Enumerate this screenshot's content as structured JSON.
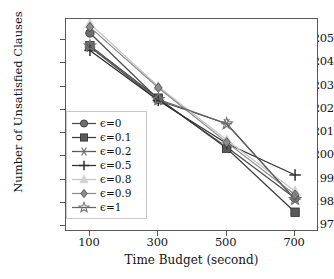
{
  "chart_data": {
    "type": "line",
    "title": "",
    "xlabel": "Time Budget (second)",
    "ylabel": "Number of Unsatisfied Clauses",
    "x": [
      100,
      300,
      500,
      700
    ],
    "xtick_labels": [
      "100",
      "300",
      "500",
      "700"
    ],
    "ytick_labels": [
      "197",
      "198",
      "199",
      "200",
      "201",
      "202",
      "203",
      "204",
      "205"
    ],
    "yticks": [
      197,
      198,
      199,
      200,
      201,
      202,
      203,
      204,
      205
    ],
    "xlim": [
      30,
      770
    ],
    "ylim": [
      196.75,
      205.9
    ],
    "grid": false,
    "legend_position": "center-left",
    "series": [
      {
        "name": "ϵ=0",
        "marker": "circle",
        "color": "#6e6e6e",
        "line_color": "#4d4d4d",
        "values": [
          205.3,
          202.45,
          200.4,
          198.2
        ]
      },
      {
        "name": "ϵ=0.1",
        "marker": "square",
        "color": "#5a5a5a",
        "line_color": "#3d3d3d",
        "values": [
          204.75,
          202.5,
          200.35,
          197.6
        ]
      },
      {
        "name": "ϵ=0.2",
        "marker": "asterisk",
        "color": "#707070",
        "line_color": "#555555",
        "values": [
          204.7,
          202.4,
          201.4,
          198.15
        ]
      },
      {
        "name": "ϵ=0.5",
        "marker": "plus",
        "color": "#2e2e2e",
        "line_color": "#2e2e2e",
        "values": [
          204.55,
          202.4,
          200.55,
          199.2
        ]
      },
      {
        "name": "ϵ=0.8",
        "marker": "triangle",
        "color": "#d2d2d2",
        "line_color": "#c4c4c4",
        "values": [
          205.7,
          203.0,
          200.7,
          198.5
        ]
      },
      {
        "name": "ϵ=0.9",
        "marker": "diamond",
        "color": "#8c8c8c",
        "line_color": "#8c8c8c",
        "values": [
          205.55,
          202.95,
          200.6,
          198.35
        ]
      },
      {
        "name": "ϵ=1",
        "marker": "star",
        "color": "#767676",
        "line_color": "#606060",
        "values": [
          204.75,
          202.45,
          201.4,
          198.15
        ]
      }
    ]
  },
  "axes": {
    "frame_color": "#5a5a5a"
  }
}
